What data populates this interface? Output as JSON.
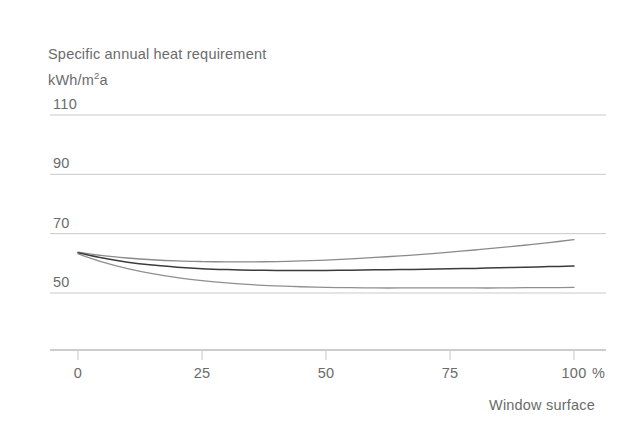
{
  "chart_data": {
    "type": "line",
    "title": "Specific annual heat requirement",
    "ylabel": "kWh/m2a",
    "ylabel_base": "kWh/m",
    "ylabel_sup": "2",
    "ylabel_tail": "a",
    "xlabel": "Window surface",
    "x_unit": "%",
    "x": [
      0,
      25,
      50,
      75,
      100
    ],
    "xtick_labels": [
      "0",
      "25",
      "50",
      "75",
      "100"
    ],
    "ytick_labels": [
      "110",
      "90",
      "70",
      "50"
    ],
    "ytick_values": [
      110,
      90,
      70,
      50
    ],
    "xlim": [
      0,
      100
    ],
    "ylim": [
      50,
      110
    ],
    "grid": true,
    "legend": "none",
    "series": [
      {
        "name": "upper-curve",
        "color": "#8a8a8a",
        "width": 1.3,
        "points": [
          [
            0,
            63.8
          ],
          [
            5,
            62.6
          ],
          [
            10,
            61.8
          ],
          [
            15,
            61.2
          ],
          [
            20,
            60.8
          ],
          [
            25,
            60.6
          ],
          [
            30,
            60.5
          ],
          [
            35,
            60.5
          ],
          [
            40,
            60.6
          ],
          [
            45,
            60.8
          ],
          [
            50,
            61.1
          ],
          [
            55,
            61.5
          ],
          [
            60,
            62.0
          ],
          [
            65,
            62.5
          ],
          [
            70,
            63.1
          ],
          [
            75,
            63.8
          ],
          [
            80,
            64.5
          ],
          [
            85,
            65.3
          ],
          [
            90,
            66.1
          ],
          [
            95,
            67.0
          ],
          [
            100,
            68.0
          ]
        ]
      },
      {
        "name": "middle-curve",
        "color": "#3b3b3b",
        "width": 1.5,
        "points": [
          [
            0,
            63.6
          ],
          [
            5,
            61.8
          ],
          [
            10,
            60.4
          ],
          [
            15,
            59.4
          ],
          [
            20,
            58.7
          ],
          [
            25,
            58.2
          ],
          [
            30,
            57.9
          ],
          [
            35,
            57.7
          ],
          [
            40,
            57.6
          ],
          [
            45,
            57.6
          ],
          [
            50,
            57.6
          ],
          [
            55,
            57.7
          ],
          [
            60,
            57.8
          ],
          [
            65,
            57.9
          ],
          [
            70,
            58.0
          ],
          [
            75,
            58.2
          ],
          [
            80,
            58.3
          ],
          [
            85,
            58.5
          ],
          [
            90,
            58.7
          ],
          [
            95,
            58.9
          ],
          [
            100,
            59.1
          ]
        ]
      },
      {
        "name": "lower-curve",
        "color": "#8f8f8f",
        "width": 1.3,
        "points": [
          [
            0,
            63.2
          ],
          [
            5,
            60.4
          ],
          [
            10,
            58.2
          ],
          [
            15,
            56.5
          ],
          [
            20,
            55.2
          ],
          [
            25,
            54.2
          ],
          [
            30,
            53.4
          ],
          [
            35,
            52.8
          ],
          [
            40,
            52.4
          ],
          [
            45,
            52.1
          ],
          [
            50,
            51.9
          ],
          [
            55,
            51.8
          ],
          [
            60,
            51.7
          ],
          [
            65,
            51.7
          ],
          [
            70,
            51.7
          ],
          [
            75,
            51.7
          ],
          [
            80,
            51.7
          ],
          [
            85,
            51.7
          ],
          [
            90,
            51.8
          ],
          [
            95,
            51.8
          ],
          [
            100,
            51.9
          ]
        ]
      }
    ],
    "colors": {
      "gridline": "#c9c9c9",
      "axis": "#9b9b9b",
      "text": "#6b6b6b",
      "background": "#ffffff"
    }
  }
}
